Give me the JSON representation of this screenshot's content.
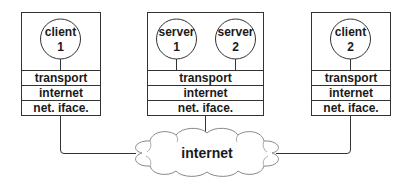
{
  "diagram": {
    "hosts": [
      {
        "id": "client-1",
        "apps": [
          {
            "line1": "client",
            "line2": "1"
          }
        ],
        "layers": [
          "transport",
          "internet",
          "net. iface."
        ]
      },
      {
        "id": "server-host",
        "apps": [
          {
            "line1": "server",
            "line2": "1"
          },
          {
            "line1": "server",
            "line2": "2"
          }
        ],
        "layers": [
          "transport",
          "internet",
          "net. iface."
        ]
      },
      {
        "id": "client-2",
        "apps": [
          {
            "line1": "client",
            "line2": "2"
          }
        ],
        "layers": [
          "transport",
          "internet",
          "net. iface."
        ]
      }
    ],
    "network": {
      "label": "internet"
    },
    "colors": {
      "stroke": "#333333",
      "text": "#1a1a1a",
      "background": "#ffffff"
    }
  }
}
